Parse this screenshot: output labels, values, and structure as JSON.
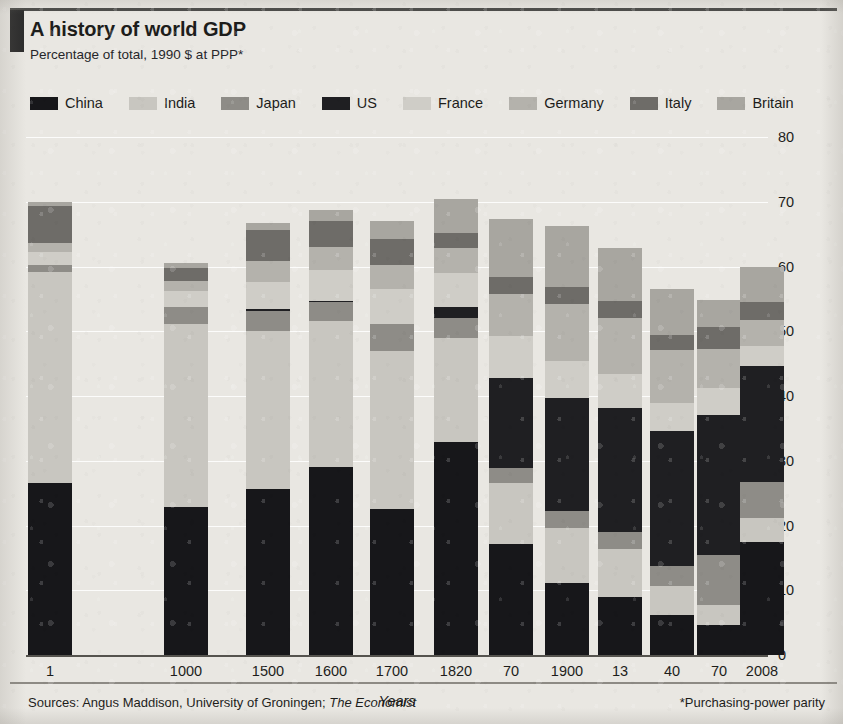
{
  "header": {
    "title": "A history of world GDP",
    "subtitle": "Percentage of total, 1990 $ at PPP*"
  },
  "footer": {
    "sources_prefix": "Sources: Angus Maddison, University of Groningen; ",
    "sources_italic": "The Economist",
    "footnote": "*Purchasing-power parity"
  },
  "colors": {
    "china": "#17171a",
    "india": "#c8c6c0",
    "japan": "#8e8c87",
    "us": "#1f1f22",
    "france": "#cfcdc7",
    "germany": "#b4b2ac",
    "italy": "#6e6c68",
    "britain": "#a8a6a0",
    "background": "#e9e7e2",
    "rule": "#4a4a48",
    "text": "#1d1d1b"
  },
  "chart_data": {
    "type": "bar",
    "stacked": true,
    "title": "A history of world GDP",
    "subtitle": "Percentage of total, 1990 $ at PPP*",
    "xlabel": "Years",
    "ylabel": "",
    "ylim": [
      0,
      80
    ],
    "yticks": [
      0,
      10,
      20,
      30,
      40,
      50,
      60,
      70,
      80
    ],
    "grid": true,
    "legend_position": "top",
    "categories": [
      "1",
      "1000",
      "1500",
      "1600",
      "1700",
      "1820",
      "70",
      "1900",
      "13",
      "40",
      "70",
      "2008"
    ],
    "series": [
      {
        "name": "China",
        "color": "#17171a",
        "values": [
          26.5,
          22.8,
          25.6,
          29.1,
          22.5,
          32.9,
          17.1,
          11.1,
          8.9,
          6.2,
          4.6,
          17.5
        ]
      },
      {
        "name": "India",
        "color": "#c8c6c0",
        "values": [
          32.6,
          28.3,
          24.4,
          22.5,
          24.5,
          16.1,
          9.5,
          8.5,
          7.5,
          4.5,
          3.1,
          3.6
        ]
      },
      {
        "name": "Japan",
        "color": "#8e8c87",
        "values": [
          1.2,
          2.7,
          3.1,
          2.9,
          4.1,
          3.0,
          2.3,
          2.6,
          2.6,
          3.0,
          7.8,
          5.6
        ]
      },
      {
        "name": "US",
        "color": "#1f1f22",
        "values": [
          0.0,
          0.0,
          0.3,
          0.2,
          0.1,
          1.8,
          13.9,
          17.5,
          19.1,
          20.9,
          21.5,
          17.9
        ]
      },
      {
        "name": "France",
        "color": "#cfcdc7",
        "values": [
          2.0,
          2.4,
          4.2,
          4.7,
          5.3,
          5.2,
          6.5,
          5.7,
          5.3,
          4.4,
          4.3,
          3.1
        ]
      },
      {
        "name": "Germany",
        "color": "#b4b2ac",
        "values": [
          1.4,
          1.6,
          3.3,
          3.6,
          3.7,
          3.8,
          6.5,
          8.8,
          8.7,
          8.1,
          5.9,
          4.0
        ]
      },
      {
        "name": "Italy",
        "color": "#6e6c68",
        "values": [
          5.6,
          2.0,
          4.7,
          4.0,
          4.0,
          2.4,
          2.6,
          2.6,
          2.5,
          2.4,
          3.5,
          2.8
        ]
      },
      {
        "name": "Britain",
        "color": "#a8a6a0",
        "values": [
          0.7,
          0.7,
          1.1,
          1.8,
          2.9,
          5.2,
          9.0,
          9.4,
          8.3,
          7.0,
          4.2,
          5.5
        ]
      }
    ]
  },
  "legend": {
    "items": [
      {
        "label": "China",
        "swatch": "china-swatch"
      },
      {
        "label": "India",
        "swatch": "india-swatch"
      },
      {
        "label": "Japan",
        "swatch": "japan-swatch"
      },
      {
        "label": "US",
        "swatch": "us-swatch"
      },
      {
        "label": "France",
        "swatch": "france-swatch"
      },
      {
        "label": "Germany",
        "swatch": "germany-swatch"
      },
      {
        "label": "Italy",
        "swatch": "italy-swatch"
      },
      {
        "label": "Britain",
        "swatch": "britain-swatch"
      }
    ]
  },
  "axis": {
    "x_title": "Years",
    "y_ticks": [
      "0",
      "10",
      "20",
      "30",
      "40",
      "50",
      "60",
      "70",
      "80"
    ],
    "x_ticks": [
      "1",
      "1000",
      "1500",
      "1600",
      "1700",
      "1820",
      "70",
      "1900",
      "13",
      "40",
      "70",
      "2008"
    ]
  }
}
